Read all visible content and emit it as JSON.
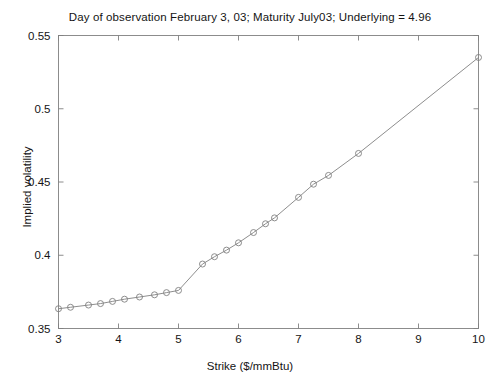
{
  "chart_data": {
    "type": "line",
    "title": "Day of observation February 3, 03; Maturity July03; Underlying = 4.96",
    "xlabel": "Strike ($/mmBtu)",
    "ylabel": "Implied volatility",
    "xlim": [
      3,
      10
    ],
    "ylim": [
      0.35,
      0.55
    ],
    "xticks": [
      3,
      4,
      5,
      6,
      7,
      8,
      9,
      10
    ],
    "xtick_labels": [
      "3",
      "4",
      "5",
      "6",
      "7",
      "8",
      "9",
      "10"
    ],
    "yticks": [
      0.35,
      0.4,
      0.45,
      0.5,
      0.55
    ],
    "ytick_labels": [
      "0.35",
      "0.4",
      "0.45",
      "0.5",
      "0.55"
    ],
    "grid": false,
    "legend": false,
    "marker": "circle-open",
    "line_color": "#808080",
    "marker_color": "#808080",
    "series": [
      {
        "name": "Implied volatility smile",
        "x": [
          3.0,
          3.2,
          3.5,
          3.7,
          3.9,
          4.1,
          4.35,
          4.6,
          4.8,
          5.0,
          5.4,
          5.6,
          5.8,
          6.0,
          6.25,
          6.45,
          6.6,
          7.0,
          7.25,
          7.5,
          8.0,
          10.0
        ],
        "y": [
          0.3635,
          0.3645,
          0.366,
          0.367,
          0.3685,
          0.37,
          0.3715,
          0.373,
          0.3745,
          0.376,
          0.394,
          0.399,
          0.4035,
          0.4085,
          0.4155,
          0.4215,
          0.4255,
          0.4395,
          0.4485,
          0.4545,
          0.4695,
          0.535
        ]
      }
    ]
  },
  "figure": {
    "background": "#ffffff",
    "axis_color": "#808080"
  }
}
